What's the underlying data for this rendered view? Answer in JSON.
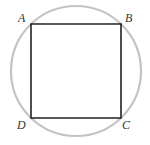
{
  "figure": {
    "colors": {
      "circle_stroke": "#c4c4c4",
      "square_stroke": "#222222",
      "label": "#333333",
      "background": "#ffffff"
    },
    "circle": {
      "cx": 76,
      "cy": 71,
      "r": 65
    },
    "square": {
      "vertices": [
        {
          "name": "A",
          "x": 31,
          "y": 24
        },
        {
          "name": "B",
          "x": 121,
          "y": 24
        },
        {
          "name": "C",
          "x": 121,
          "y": 118
        },
        {
          "name": "D",
          "x": 31,
          "y": 118
        }
      ]
    },
    "labels": {
      "A": "A",
      "B": "B",
      "C": "C",
      "D": "D"
    }
  }
}
